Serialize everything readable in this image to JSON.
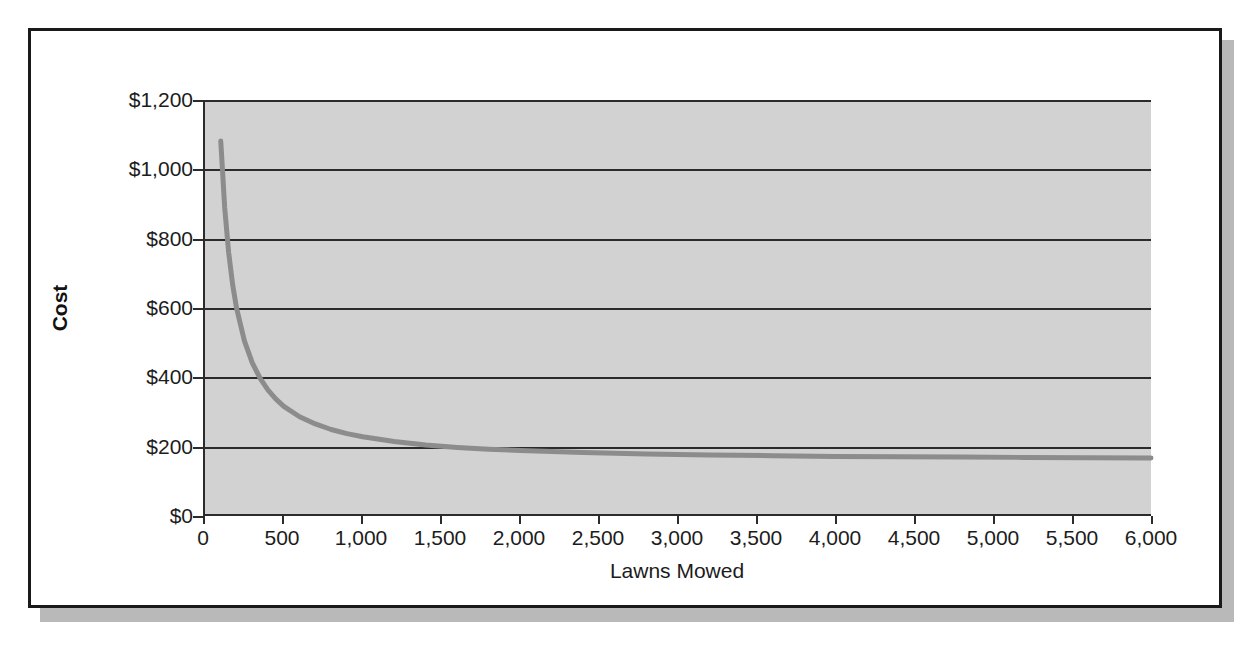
{
  "chart_data": {
    "type": "line",
    "title": "",
    "xlabel": "Lawns Mowed",
    "ylabel": "Cost",
    "xlim": [
      0,
      6000
    ],
    "ylim": [
      0,
      1200
    ],
    "grid": true,
    "legend": "none",
    "y_tick_labels": [
      "$1,200",
      "$1,000",
      "$800",
      "$600",
      "$400",
      "$200",
      "$0"
    ],
    "y_tick_values": [
      1200,
      1000,
      800,
      600,
      400,
      200,
      0
    ],
    "x_tick_labels": [
      "0",
      "500",
      "1,000",
      "1,500",
      "2,000",
      "2,500",
      "3,000",
      "3,500",
      "4,000",
      "4,500",
      "5,000",
      "5,500",
      "6,000"
    ],
    "x_tick_values": [
      0,
      500,
      1000,
      1500,
      2000,
      2500,
      3000,
      3500,
      4000,
      4500,
      5000,
      5500,
      6000
    ],
    "series": [
      {
        "name": "Average cost per lawn",
        "color": "#8c8c8c",
        "line_width": 5,
        "x": [
          100,
          125,
          150,
          175,
          200,
          250,
          300,
          350,
          400,
          450,
          500,
          600,
          700,
          800,
          900,
          1000,
          1200,
          1400,
          1600,
          1800,
          2000,
          2400,
          2800,
          3200,
          3600,
          4000,
          4400,
          4800,
          5200,
          5600,
          6000
        ],
        "y": [
          1081,
          887,
          758,
          666,
          597,
          502,
          438,
          393,
          359,
          333,
          312,
          282,
          261,
          245,
          233,
          224,
          210,
          200,
          193,
          188,
          184,
          178,
          174,
          171,
          169,
          167,
          166,
          165,
          164,
          163,
          162
        ]
      }
    ],
    "axis_color": "#2b2b2b",
    "plot_background": "#d2d2d2",
    "figure_background": "#ffffff"
  },
  "figure": {
    "border_color": "#1a1a1a",
    "shadow_color": "#b9b9b9"
  }
}
